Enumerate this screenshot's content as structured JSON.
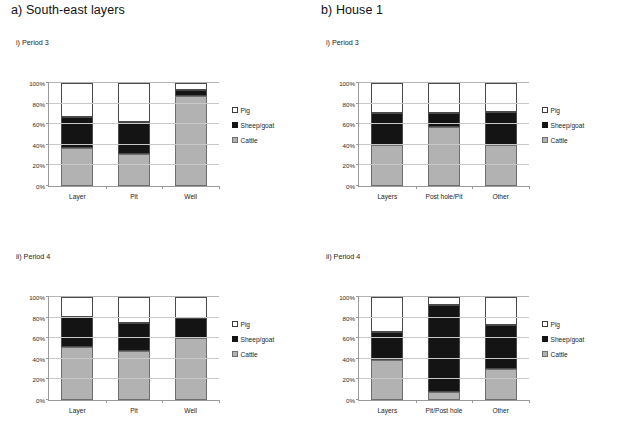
{
  "figure": {
    "panels": [
      {
        "id": "a-period3",
        "section_title": "a) South-east layers",
        "sub_title": "i) Period 3",
        "chart_data": {
          "type": "bar",
          "subtype": "stacked-100-percent",
          "title": "i) Period 3",
          "xlabel": "",
          "ylabel": "",
          "ylim": [
            0,
            100
          ],
          "ytick_labels": [
            "0%",
            "20%",
            "40%",
            "60%",
            "80%",
            "100%"
          ],
          "ytick_values": [
            0,
            20,
            40,
            60,
            80,
            100
          ],
          "grid": true,
          "legend_position": "right",
          "categories": [
            "Layer",
            "Pit",
            "Well"
          ],
          "series": [
            {
              "name": "Cattle",
              "color": "#b2b2b2",
              "values": [
                37,
                31,
                87
              ]
            },
            {
              "name": "Sheep/goat",
              "color": "#141414",
              "values": [
                30,
                31,
                6
              ]
            },
            {
              "name": "Pig",
              "color": "#ffffff",
              "values": [
                33,
                38,
                7
              ]
            }
          ]
        }
      },
      {
        "id": "b-period3",
        "section_title": "b) House 1",
        "sub_title": "i) Period 3",
        "chart_data": {
          "type": "bar",
          "subtype": "stacked-100-percent",
          "title": "i) Period 3",
          "xlabel": "",
          "ylabel": "",
          "ylim": [
            0,
            100
          ],
          "ytick_labels": [
            "0%",
            "20%",
            "40%",
            "60%",
            "80%",
            "100%"
          ],
          "ytick_values": [
            0,
            20,
            40,
            60,
            80,
            100
          ],
          "grid": true,
          "legend_position": "right",
          "categories": [
            "Layers",
            "Post hole/Pit",
            "Other"
          ],
          "series": [
            {
              "name": "Cattle",
              "color": "#b2b2b2",
              "values": [
                40,
                57,
                40
              ]
            },
            {
              "name": "Sheep/goat",
              "color": "#141414",
              "values": [
                31,
                14,
                32
              ]
            },
            {
              "name": "Pig",
              "color": "#ffffff",
              "values": [
                29,
                29,
                28
              ]
            }
          ]
        }
      },
      {
        "id": "a-period4",
        "section_title": "",
        "sub_title": "ii) Period 4",
        "chart_data": {
          "type": "bar",
          "subtype": "stacked-100-percent",
          "title": "ii) Period 4",
          "xlabel": "",
          "ylabel": "",
          "ylim": [
            0,
            100
          ],
          "ytick_labels": [
            "0%",
            "20%",
            "40%",
            "60%",
            "80%",
            "100%"
          ],
          "ytick_values": [
            0,
            20,
            40,
            60,
            80,
            100
          ],
          "grid": true,
          "legend_position": "right",
          "categories": [
            "Layer",
            "Pit",
            "Well"
          ],
          "series": [
            {
              "name": "Cattle",
              "color": "#b2b2b2",
              "values": [
                51,
                48,
                60
              ]
            },
            {
              "name": "Sheep/goat",
              "color": "#141414",
              "values": [
                30,
                27,
                20
              ]
            },
            {
              "name": "Pig",
              "color": "#ffffff",
              "values": [
                19,
                25,
                20
              ]
            }
          ]
        }
      },
      {
        "id": "b-period4",
        "section_title": "",
        "sub_title": "ii) Period 4",
        "chart_data": {
          "type": "bar",
          "subtype": "stacked-100-percent",
          "title": "ii) Period 4",
          "xlabel": "",
          "ylabel": "",
          "ylim": [
            0,
            100
          ],
          "ytick_labels": [
            "0%",
            "20%",
            "40%",
            "60%",
            "80%",
            "100%"
          ],
          "ytick_values": [
            0,
            20,
            40,
            60,
            80,
            100
          ],
          "grid": true,
          "legend_position": "right",
          "categories": [
            "Layers",
            "Pit/Post hole",
            "Other"
          ],
          "series": [
            {
              "name": "Cattle",
              "color": "#b2b2b2",
              "values": [
                39,
                8,
                30
              ]
            },
            {
              "name": "Sheep/goat",
              "color": "#141414",
              "values": [
                27,
                84,
                43
              ]
            },
            {
              "name": "Pig",
              "color": "#ffffff",
              "values": [
                34,
                8,
                27
              ]
            }
          ]
        }
      }
    ],
    "legend": {
      "entries": [
        {
          "label": "Pig",
          "swatch": "pig-swatch-icon",
          "color": "#ffffff"
        },
        {
          "label": "Sheep/goat",
          "swatch": "sheepgoat-swatch-icon",
          "color": "#141414"
        },
        {
          "label": "Cattle",
          "swatch": "cattle-swatch-icon",
          "color": "#b2b2b2"
        }
      ]
    }
  }
}
